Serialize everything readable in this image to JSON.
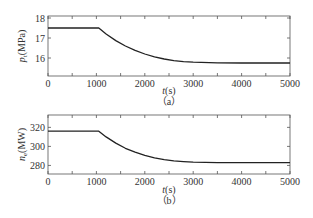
{
  "chart_data": [
    {
      "type": "line",
      "panel": "(a)",
      "title": "",
      "xlabel": "t(s)",
      "ylabel": "p_t (MPa)",
      "ylabel_main": "p",
      "ylabel_sub": "t",
      "ylabel_unit": "(MPa)",
      "caption": "（a）",
      "xlim": [
        0,
        5000
      ],
      "ylim": [
        15.1,
        18.1
      ],
      "xticks": [
        0,
        1000,
        2000,
        3000,
        4000,
        5000
      ],
      "yticks": [
        16,
        17,
        18
      ],
      "grid": false,
      "series": [
        {
          "name": "p_t",
          "x": [
            0,
            1000,
            1050,
            1200,
            1400,
            1600,
            1800,
            2000,
            2200,
            2400,
            2600,
            2800,
            3000,
            3500,
            4000,
            4500,
            5000
          ],
          "values": [
            17.5,
            17.5,
            17.5,
            17.2,
            16.87,
            16.6,
            16.38,
            16.2,
            16.06,
            15.95,
            15.87,
            15.82,
            15.79,
            15.76,
            15.75,
            15.75,
            15.75
          ]
        }
      ]
    },
    {
      "type": "line",
      "panel": "(b)",
      "title": "",
      "xlabel": "t(s)",
      "ylabel": "n_e (MW)",
      "ylabel_main": "n",
      "ylabel_sub": "e",
      "ylabel_unit": "(MW)",
      "caption": "（b）",
      "xlim": [
        0,
        5000
      ],
      "ylim": [
        271,
        333
      ],
      "xticks": [
        0,
        1000,
        2000,
        3000,
        4000,
        5000
      ],
      "yticks": [
        280,
        300,
        320
      ],
      "grid": false,
      "series": [
        {
          "name": "n_e",
          "x": [
            0,
            1000,
            1050,
            1200,
            1400,
            1600,
            1800,
            2000,
            2200,
            2400,
            2600,
            2800,
            3000,
            3500,
            4000,
            4500,
            5000
          ],
          "values": [
            316,
            316,
            316,
            310,
            303.5,
            298,
            294,
            290.5,
            288,
            286,
            284.8,
            284,
            283.5,
            283,
            283,
            283,
            283
          ]
        }
      ]
    }
  ]
}
